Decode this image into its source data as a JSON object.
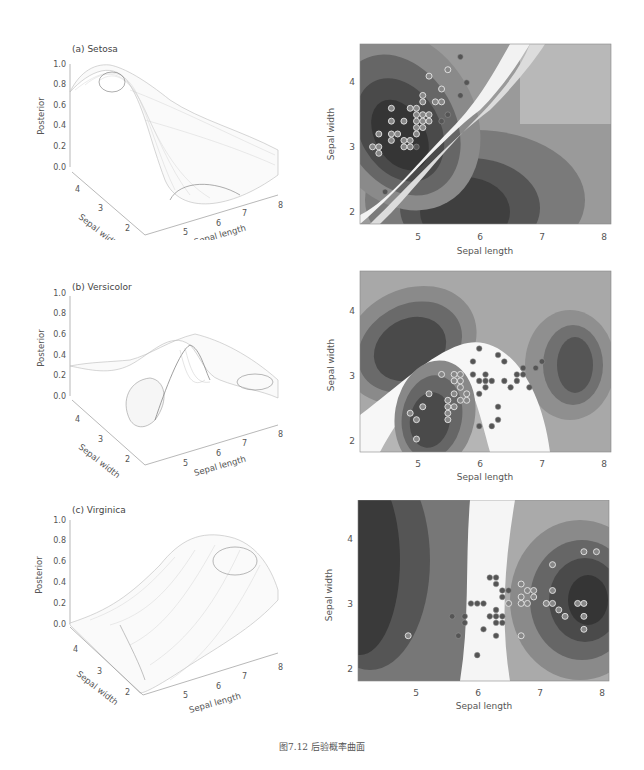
{
  "figure": {
    "caption": "图7.12   后验概率曲面"
  },
  "chart_data": [
    {
      "type": "surface3d",
      "title": "(a) Setosa",
      "zlabel": "Posterior",
      "xlabel": "Sepal length",
      "ylabel": "Sepal width",
      "z_ticks": [
        "0.0",
        "0.2",
        "0.4",
        "0.6",
        "0.8",
        "1.0"
      ],
      "x_ticks": [
        "5",
        "6",
        "7",
        "8"
      ],
      "y_ticks": [
        "2",
        "3",
        "4"
      ],
      "zlim": [
        0,
        1
      ],
      "description": "High ridge (~0.9) at short length / wide width, dropping to ~0 across diagonal valley, plateau ~0.5 at long length"
    },
    {
      "type": "contour",
      "title": "Setosa posterior contour",
      "xlabel": "Sepal length",
      "ylabel": "Sepal width",
      "x_ticks": [
        "5",
        "6",
        "7",
        "8"
      ],
      "y_ticks": [
        "2",
        "3",
        "4"
      ],
      "xlim": [
        4.1,
        8.1
      ],
      "ylim": [
        1.8,
        4.6
      ],
      "points_highlighted": [
        [
          4.3,
          3.0
        ],
        [
          4.4,
          3.0
        ],
        [
          4.4,
          2.9
        ],
        [
          4.4,
          3.2
        ],
        [
          4.6,
          3.1
        ],
        [
          4.6,
          3.2
        ],
        [
          4.6,
          3.4
        ],
        [
          4.6,
          3.6
        ],
        [
          4.7,
          3.2
        ],
        [
          4.8,
          3.0
        ],
        [
          4.8,
          3.1
        ],
        [
          4.8,
          3.4
        ],
        [
          4.9,
          3.0
        ],
        [
          4.9,
          3.1
        ],
        [
          4.9,
          3.6
        ],
        [
          5.0,
          3.2
        ],
        [
          5.0,
          3.3
        ],
        [
          5.0,
          3.4
        ],
        [
          5.0,
          3.5
        ],
        [
          5.0,
          3.6
        ],
        [
          5.1,
          3.3
        ],
        [
          5.1,
          3.4
        ],
        [
          5.1,
          3.5
        ],
        [
          5.1,
          3.7
        ],
        [
          5.1,
          3.8
        ],
        [
          5.2,
          3.4
        ],
        [
          5.2,
          3.5
        ],
        [
          5.2,
          4.1
        ],
        [
          5.3,
          3.7
        ],
        [
          5.4,
          3.7
        ],
        [
          5.4,
          3.9
        ],
        [
          5.5,
          4.2
        ]
      ],
      "points_dark": [
        [
          4.5,
          2.3
        ],
        [
          5.0,
          3.0
        ],
        [
          5.4,
          3.4
        ],
        [
          5.5,
          3.5
        ],
        [
          5.7,
          3.8
        ],
        [
          5.7,
          4.4
        ],
        [
          5.8,
          4.0
        ]
      ]
    },
    {
      "type": "surface3d",
      "title": "(b) Versicolor",
      "zlabel": "Posterior",
      "xlabel": "Sepal length",
      "ylabel": "Sepal width",
      "z_ticks": [
        "0.0",
        "0.2",
        "0.4",
        "0.6",
        "0.8",
        "1.0"
      ],
      "x_ticks": [
        "5",
        "6",
        "7",
        "8"
      ],
      "y_ticks": [
        "2",
        "3",
        "4"
      ],
      "zlim": [
        0,
        1
      ],
      "description": "Sharp peak ~0.5 near length 5.5 / width 2.5, valleys near 0 elsewhere"
    },
    {
      "type": "contour",
      "title": "Versicolor posterior contour",
      "xlabel": "Sepal length",
      "ylabel": "Sepal width",
      "x_ticks": [
        "5",
        "6",
        "7",
        "8"
      ],
      "y_ticks": [
        "2",
        "3",
        "4"
      ],
      "xlim": [
        4.1,
        8.1
      ],
      "ylim": [
        1.8,
        4.6
      ],
      "points_highlighted": [
        [
          4.9,
          2.4
        ],
        [
          5.0,
          2.0
        ],
        [
          5.0,
          2.3
        ],
        [
          5.1,
          2.5
        ],
        [
          5.2,
          2.7
        ],
        [
          5.4,
          3.0
        ],
        [
          5.5,
          2.3
        ],
        [
          5.5,
          2.4
        ],
        [
          5.5,
          2.5
        ],
        [
          5.5,
          2.6
        ],
        [
          5.6,
          2.5
        ],
        [
          5.6,
          2.7
        ],
        [
          5.6,
          2.9
        ],
        [
          5.6,
          3.0
        ],
        [
          5.7,
          2.6
        ],
        [
          5.7,
          2.8
        ],
        [
          5.7,
          2.9
        ],
        [
          5.7,
          3.0
        ],
        [
          5.8,
          2.6
        ],
        [
          5.8,
          2.7
        ]
      ],
      "points_dark": [
        [
          5.9,
          3.0
        ],
        [
          5.9,
          3.2
        ],
        [
          6.0,
          2.2
        ],
        [
          6.0,
          2.7
        ],
        [
          6.0,
          2.9
        ],
        [
          6.0,
          3.4
        ],
        [
          6.1,
          2.8
        ],
        [
          6.1,
          2.9
        ],
        [
          6.1,
          3.0
        ],
        [
          6.2,
          2.2
        ],
        [
          6.2,
          2.9
        ],
        [
          6.3,
          2.3
        ],
        [
          6.3,
          2.5
        ],
        [
          6.3,
          3.3
        ],
        [
          6.4,
          2.9
        ],
        [
          6.4,
          3.2
        ],
        [
          6.5,
          2.8
        ],
        [
          6.6,
          2.9
        ],
        [
          6.6,
          3.0
        ],
        [
          6.7,
          3.0
        ],
        [
          6.7,
          3.1
        ],
        [
          6.8,
          2.8
        ],
        [
          6.9,
          3.1
        ],
        [
          7.0,
          3.2
        ]
      ]
    },
    {
      "type": "surface3d",
      "title": "(c) Virginica",
      "zlabel": "Posterior",
      "xlabel": "Sepal length",
      "ylabel": "Sepal width",
      "z_ticks": [
        "0.0",
        "0.2",
        "0.4",
        "0.6",
        "0.8",
        "1.0"
      ],
      "x_ticks": [
        "5",
        "6",
        "7",
        "8"
      ],
      "y_ticks": [
        "2",
        "3",
        "4"
      ],
      "zlim": [
        0,
        1
      ],
      "description": "Sigmoid rising from ~0 at short length to ~0.85 at long length"
    },
    {
      "type": "contour",
      "title": "Virginica posterior contour",
      "xlabel": "Sepal length",
      "ylabel": "Sepal width",
      "x_ticks": [
        "5",
        "6",
        "7",
        "8"
      ],
      "y_ticks": [
        "2",
        "3",
        "4"
      ],
      "xlim": [
        4.1,
        8.1
      ],
      "ylim": [
        1.8,
        4.6
      ],
      "points_highlighted": [
        [
          4.9,
          2.5
        ],
        [
          6.5,
          3.0
        ],
        [
          6.7,
          2.5
        ],
        [
          6.7,
          3.0
        ],
        [
          6.7,
          3.1
        ],
        [
          6.7,
          3.3
        ],
        [
          6.8,
          3.0
        ],
        [
          6.8,
          3.2
        ],
        [
          6.9,
          3.1
        ],
        [
          6.9,
          3.2
        ],
        [
          7.1,
          3.0
        ],
        [
          7.2,
          3.0
        ],
        [
          7.2,
          3.2
        ],
        [
          7.2,
          3.6
        ],
        [
          7.3,
          2.9
        ],
        [
          7.4,
          2.8
        ],
        [
          7.6,
          3.0
        ],
        [
          7.7,
          2.6
        ],
        [
          7.7,
          2.8
        ],
        [
          7.7,
          3.0
        ],
        [
          7.7,
          3.8
        ],
        [
          7.9,
          3.8
        ]
      ],
      "points_dark": [
        [
          5.6,
          2.8
        ],
        [
          5.7,
          2.5
        ],
        [
          5.8,
          2.7
        ],
        [
          5.8,
          2.8
        ],
        [
          5.9,
          3.0
        ],
        [
          6.0,
          2.2
        ],
        [
          6.0,
          3.0
        ],
        [
          6.1,
          2.6
        ],
        [
          6.1,
          3.0
        ],
        [
          6.2,
          2.8
        ],
        [
          6.2,
          3.4
        ],
        [
          6.3,
          2.5
        ],
        [
          6.3,
          2.7
        ],
        [
          6.3,
          2.8
        ],
        [
          6.3,
          2.9
        ],
        [
          6.3,
          3.3
        ],
        [
          6.3,
          3.4
        ],
        [
          6.4,
          2.7
        ],
        [
          6.4,
          2.8
        ],
        [
          6.4,
          3.1
        ],
        [
          6.4,
          3.2
        ],
        [
          6.5,
          3.2
        ]
      ]
    }
  ]
}
